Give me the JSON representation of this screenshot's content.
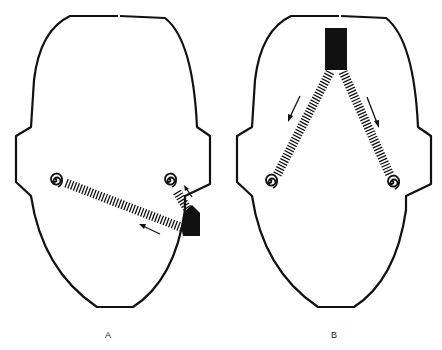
{
  "figure": {
    "panels": [
      {
        "id": "A",
        "label": "A",
        "description": "Head outline (top view) with sound source at right cheek; waves travel to left and right ears",
        "source": {
          "shape": "filled-rectangle",
          "position": "right-lower-face"
        },
        "ears": [
          "left-spiral",
          "right-spiral"
        ],
        "arrows": [
          "toward-left-ear",
          "toward-right-ear"
        ]
      },
      {
        "id": "B",
        "label": "B",
        "description": "Head outline (top view) with sound source at top center; waves travel equally down to both ears",
        "source": {
          "shape": "filled-rectangle",
          "position": "top-center"
        },
        "ears": [
          "left-spiral",
          "right-spiral"
        ],
        "arrows": [
          "toward-left-ear",
          "toward-right-ear"
        ]
      }
    ],
    "colors": {
      "ink": "#111111",
      "background": "#ffffff"
    }
  }
}
